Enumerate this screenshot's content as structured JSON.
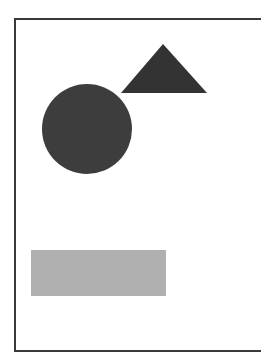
{
  "diagram": {
    "shapes": [
      {
        "type": "triangle",
        "color": "#333333",
        "points": "121,93 163,44 207,93"
      },
      {
        "type": "circle",
        "color": "#3d3d3d",
        "cx": 87,
        "cy": 129,
        "r": 45
      },
      {
        "type": "rectangle",
        "color": "#b0b0b0",
        "x": 31,
        "y": 250,
        "width": 135,
        "height": 46
      }
    ],
    "frame_color": "#3a3a3a"
  }
}
